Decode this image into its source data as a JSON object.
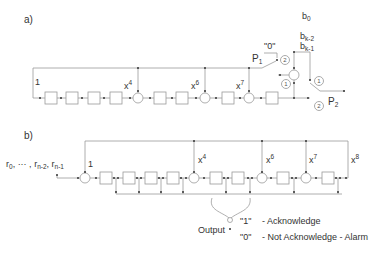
{
  "part_a": {
    "label": "a)",
    "input_tap_label": "1",
    "taps": [
      {
        "base": "x",
        "exp": "4"
      },
      {
        "base": "x",
        "exp": "6"
      },
      {
        "base": "x",
        "exp": "7"
      }
    ],
    "switch_p1": {
      "label": "P",
      "sub": "1",
      "const_label": "\"0\"",
      "pos": "2"
    },
    "switch_p2": {
      "label": "P",
      "sub": "2",
      "pos_top": "1",
      "pos_bottom": "2"
    },
    "adder_side_pos": "1",
    "bits": {
      "b0": {
        "base": "b",
        "sub": "0"
      },
      "bk2": {
        "base": "b",
        "sub": "k-2"
      },
      "bk1": {
        "base": "b",
        "sub": "k-1"
      }
    }
  },
  "part_b": {
    "label": "b)",
    "input_seq": {
      "r0": {
        "base": "r",
        "sub": "0"
      },
      "sep": ", ··· ,",
      "rn2": {
        "base": "r",
        "sub": "n-2"
      },
      "rn1": {
        "base": "r",
        "sub": "n-1"
      }
    },
    "input_tap_label": "1",
    "taps": [
      {
        "base": "x",
        "exp": "4"
      },
      {
        "base": "x",
        "exp": "6"
      },
      {
        "base": "x",
        "exp": "7"
      },
      {
        "base": "x",
        "exp": "8"
      }
    ],
    "output_label": "Output",
    "legend": [
      {
        "value": "\"1\"",
        "text": "- Acknowledge"
      },
      {
        "value": "\"0\"",
        "text": "- Not Acknowledge - Alarm"
      }
    ]
  }
}
